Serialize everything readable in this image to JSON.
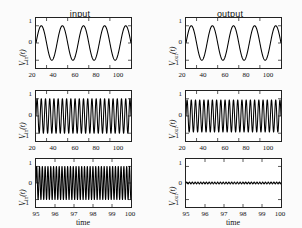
{
  "figure": {
    "columns": [
      {
        "id": "input",
        "title": "input"
      },
      {
        "id": "output",
        "title": "output"
      }
    ],
    "xlabel": "time",
    "ytick_labels": [
      "1",
      "0",
      "-1"
    ],
    "xticks_top": [
      "20",
      "40",
      "60",
      "80",
      "100"
    ],
    "xticks_bottom": [
      "95",
      "96",
      "97",
      "98",
      "99",
      "100"
    ],
    "ylabel_in": "V_in(t)",
    "ylabel_out": "V_out(t)",
    "ylabel_in_base": "V",
    "ylabel_in_sub": "in",
    "ylabel_in_arg": "(t)",
    "ylabel_out_base": "V",
    "ylabel_out_sub": "out",
    "ylabel_out_arg": "(t)",
    "line_color": "#000000",
    "axis_color": "#222222"
  },
  "chart_data": {
    "type": "line",
    "title": "",
    "xlabel": "time",
    "ylabel": "V(t)",
    "grid": false,
    "legend": "none",
    "panels": [
      {
        "row": 1,
        "column": "input",
        "title": "input",
        "ylabel": "V_in(t)",
        "xlim": [
          10,
          100
        ],
        "ylim": [
          -1.45,
          1.45
        ],
        "xticks": [
          20,
          40,
          60,
          80,
          100
        ],
        "yticks": [
          -1,
          0,
          1
        ],
        "waveform": "sine",
        "amplitude": 1.0,
        "period": 20.0,
        "cycles_visible": 4.5,
        "phase": 0.0
      },
      {
        "row": 1,
        "column": "output",
        "title": "output",
        "ylabel": "V_out(t)",
        "xlim": [
          10,
          100
        ],
        "ylim": [
          -1.45,
          1.45
        ],
        "xticks": [
          20,
          40,
          60,
          80,
          100
        ],
        "yticks": [
          -1,
          0,
          1
        ],
        "waveform": "sine",
        "amplitude": 1.0,
        "period": 20.0,
        "cycles_visible": 4.5,
        "phase": 0.0
      },
      {
        "row": 2,
        "column": "input",
        "ylabel": "V_in(t)",
        "xlim": [
          10,
          100
        ],
        "ylim": [
          -1.45,
          1.45
        ],
        "xticks": [
          20,
          40,
          60,
          80,
          100
        ],
        "yticks": [
          -1,
          0,
          1
        ],
        "waveform": "sine",
        "amplitude": 1.0,
        "period": 4.0,
        "cycles_visible": 22.5,
        "phase": 0.0
      },
      {
        "row": 2,
        "column": "output",
        "ylabel": "V_out(t)",
        "xlim": [
          10,
          100
        ],
        "ylim": [
          -1.45,
          1.45
        ],
        "xticks": [
          20,
          40,
          60,
          80,
          100
        ],
        "yticks": [
          -1,
          0,
          1
        ],
        "waveform": "sine",
        "amplitude": 0.93,
        "period": 4.0,
        "cycles_visible": 22.5,
        "phase": 0.0
      },
      {
        "row": 3,
        "column": "input",
        "ylabel": "V_in(t)",
        "xlim": [
          95,
          100
        ],
        "ylim": [
          -1.45,
          1.45
        ],
        "xticks": [
          95,
          96,
          97,
          98,
          99,
          100
        ],
        "yticks": [
          -1,
          0,
          1
        ],
        "waveform": "sine",
        "amplitude": 1.0,
        "period": 0.148,
        "cycles_visible": 34,
        "phase": 0.0
      },
      {
        "row": 3,
        "column": "output",
        "ylabel": "V_out(t)",
        "xlim": [
          95,
          100
        ],
        "ylim": [
          -1.45,
          1.45
        ],
        "xticks": [
          95,
          96,
          97,
          98,
          99,
          100
        ],
        "yticks": [
          -1,
          0,
          1
        ],
        "waveform": "sine",
        "amplitude": 0.055,
        "period": 0.148,
        "cycles_visible": 34,
        "phase": 0.0
      }
    ]
  }
}
